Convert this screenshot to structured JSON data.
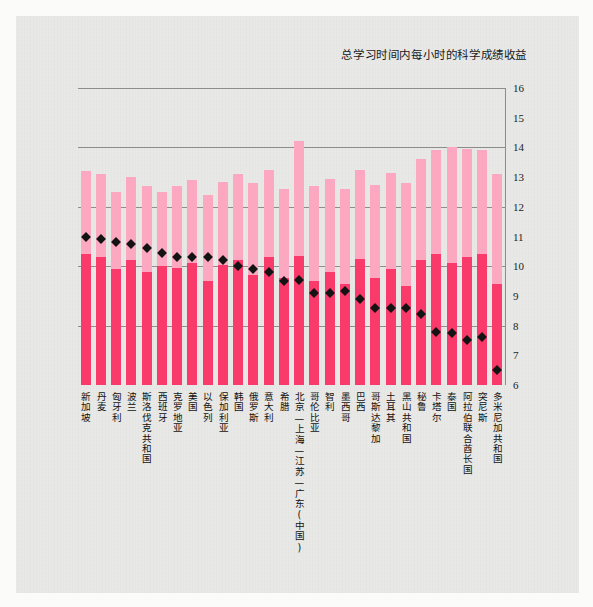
{
  "chart_data": {
    "type": "bar",
    "title": "总学习时间内每小时的科学成绩收益",
    "xlabel": "",
    "ylabel": "",
    "ylim": [
      6,
      16
    ],
    "yticks": [
      6,
      7,
      8,
      9,
      10,
      11,
      12,
      13,
      14,
      15,
      16
    ],
    "gridlines": [
      8,
      10,
      12,
      14,
      16
    ],
    "grid": true,
    "legend_position": "none",
    "stacked": true,
    "colors": {
      "lower_segment": "#fa3a6b",
      "upper_segment": "#fca8c0",
      "marker": "#131313",
      "gridline": "#8d8d8d",
      "background": "#e9e9e7"
    },
    "categories": [
      "新加坡",
      "丹麦",
      "匈牙利",
      "波兰",
      "斯洛伐克共和国",
      "西班牙",
      "克罗地亚",
      "美国",
      "以色列",
      "保加利亚",
      "韩国",
      "俄罗斯",
      "意大利",
      "希腊",
      "北京—上海—江苏—广东(中国)",
      "哥伦比亚",
      "智利",
      "墨西哥",
      "巴西",
      "哥斯达黎加",
      "土耳其",
      "黑山共和国",
      "秘鲁",
      "卡塔尔",
      "泰国",
      "阿拉伯联合酋长国",
      "突尼斯",
      "多米尼加共和国"
    ],
    "series": [
      {
        "name": "下段",
        "values": [
          10.4,
          10.3,
          9.9,
          10.2,
          9.8,
          10.0,
          9.95,
          10.1,
          9.5,
          10.05,
          10.2,
          9.7,
          10.3,
          9.6,
          10.35,
          9.5,
          9.8,
          9.4,
          10.25,
          9.6,
          9.9,
          9.35,
          10.2,
          10.4,
          10.1,
          10.3,
          10.4,
          9.4
        ]
      },
      {
        "name": "上段",
        "values": [
          2.8,
          2.8,
          2.6,
          2.8,
          2.9,
          2.5,
          2.75,
          2.8,
          2.9,
          2.8,
          2.9,
          3.1,
          2.95,
          3.0,
          3.85,
          3.2,
          3.15,
          3.2,
          3.0,
          3.15,
          3.25,
          3.45,
          3.4,
          3.5,
          3.9,
          3.65,
          3.5,
          3.7
        ]
      }
    ],
    "totals": [
      13.2,
      13.1,
      12.5,
      13.0,
      12.7,
      12.5,
      12.7,
      12.9,
      12.4,
      12.85,
      13.1,
      12.8,
      13.25,
      12.6,
      14.2,
      12.7,
      12.95,
      12.6,
      13.25,
      12.75,
      13.15,
      12.8,
      13.6,
      13.9,
      14.0,
      13.95,
      13.9,
      13.1
    ],
    "markers": {
      "name": "每小时收益",
      "values": [
        11.0,
        10.9,
        10.8,
        10.75,
        10.6,
        10.45,
        10.3,
        10.3,
        10.3,
        10.2,
        10.0,
        9.9,
        9.8,
        9.5,
        9.55,
        9.1,
        9.1,
        9.15,
        8.9,
        8.6,
        8.6,
        8.6,
        8.4,
        7.8,
        7.75,
        7.5,
        7.6,
        6.5
      ]
    }
  }
}
